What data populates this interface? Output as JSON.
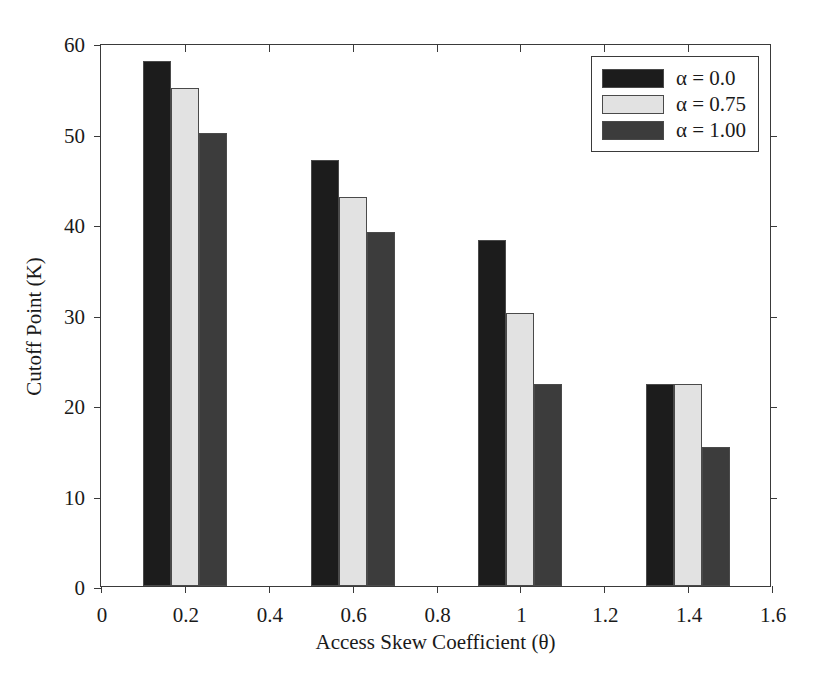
{
  "chart_data": {
    "type": "bar",
    "title": "",
    "xlabel": "Access Skew Coefficient (θ)",
    "ylabel": "Cutoff Point (K)",
    "categories": [
      "0.2",
      "0.6",
      "1",
      "1.4"
    ],
    "category_values": [
      0.2,
      0.6,
      1.0,
      1.4
    ],
    "series": [
      {
        "name": "α = 0.0",
        "color": "#1c1c1c",
        "values": [
          58.0,
          47.1,
          38.2,
          22.3
        ]
      },
      {
        "name": "α = 0.75",
        "color": "#e2e2e2",
        "values": [
          55.0,
          43.0,
          30.2,
          22.3
        ]
      },
      {
        "name": "α = 1.00",
        "color": "#3c3c3c",
        "values": [
          50.1,
          39.1,
          22.3,
          15.4
        ]
      }
    ],
    "xlim": [
      0,
      1.6
    ],
    "ylim": [
      0,
      60
    ],
    "xticks": [
      "0",
      "0.2",
      "0.4",
      "0.6",
      "0.8",
      "1",
      "1.2",
      "1.4",
      "1.6"
    ],
    "xtick_values": [
      0,
      0.2,
      0.4,
      0.6,
      0.8,
      1.0,
      1.2,
      1.4,
      1.6
    ],
    "yticks": [
      "0",
      "10",
      "20",
      "30",
      "40",
      "50",
      "60"
    ],
    "ytick_values": [
      0,
      10,
      20,
      30,
      40,
      50,
      60
    ],
    "grid": false,
    "legend_position": "top-right",
    "bar_width_units": 0.0667,
    "axis_color": "#3a3a3a",
    "background_color": "#ffffff"
  },
  "legend": {
    "entries": [
      {
        "label": "α = 0.0"
      },
      {
        "label": "α = 0.75"
      },
      {
        "label": "α = 1.00"
      }
    ]
  }
}
